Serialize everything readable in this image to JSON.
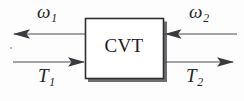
{
  "diagram": {
    "type": "block-diagram",
    "background_color": "#fdfdfd",
    "line_color": "#3a3a3e",
    "text_color": "#26262a",
    "block": {
      "label": "CVT",
      "fill_color": "#ffffff",
      "border_color": "#2f2f33",
      "shadow_color": "#5c5c60",
      "x": 85,
      "y": 18,
      "width": 78,
      "height": 60
    },
    "signals": [
      {
        "id": "omega-1",
        "symbol": "ω",
        "subscript": "1",
        "label": "ω1",
        "side": "left",
        "row": "top",
        "direction": "out",
        "arrow_points": "left",
        "line_y": 34,
        "line_from_x": 85,
        "line_to_x": 13
      },
      {
        "id": "omega-2",
        "symbol": "ω",
        "subscript": "2",
        "label": "ω2",
        "side": "right",
        "row": "top",
        "direction": "in",
        "arrow_points": "left",
        "line_y": 34,
        "line_from_x": 237,
        "line_to_x": 164
      },
      {
        "id": "torque-1",
        "symbol": "T",
        "subscript": "1",
        "label": "T1",
        "side": "left",
        "row": "bottom",
        "direction": "in",
        "arrow_points": "right",
        "line_y": 62,
        "line_from_x": 13,
        "line_to_x": 85
      },
      {
        "id": "torque-2",
        "symbol": "T",
        "subscript": "2",
        "label": "T2",
        "side": "right",
        "row": "bottom",
        "direction": "out",
        "arrow_points": "right",
        "line_y": 62,
        "line_from_x": 163,
        "line_to_x": 234
      }
    ],
    "labels": {
      "omega1_symbol": "ω",
      "omega1_sub": "1",
      "omega2_symbol": "ω",
      "omega2_sub": "2",
      "torque1_symbol": "T",
      "torque1_sub": "1",
      "torque2_symbol": "T",
      "torque2_sub": "2",
      "block_text": "CVT"
    }
  }
}
